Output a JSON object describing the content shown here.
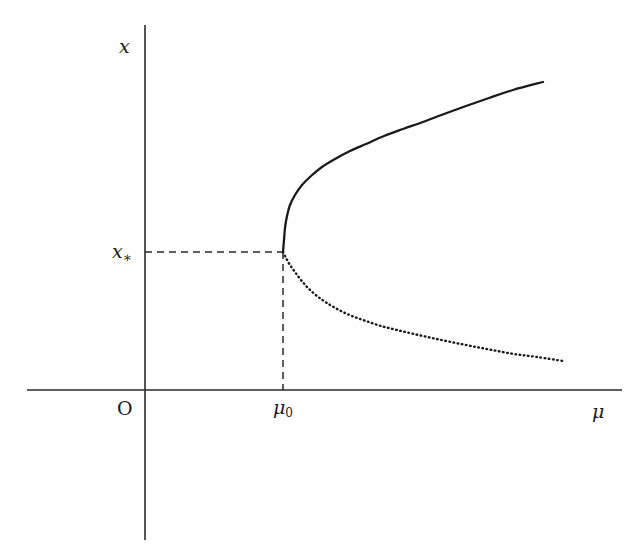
{
  "figure": {
    "name": "bifurcation-diagram",
    "background_color": "#fefefe",
    "ink_color": "#1a1a1a",
    "width": 638,
    "height": 559
  },
  "labels": {
    "y_axis": "x",
    "x_axis": "μ",
    "origin": "O",
    "x_star_base": "x",
    "x_star_sub": "∗",
    "mu_zero_base": "μ",
    "mu_zero_sub": "0"
  },
  "chart_data": {
    "type": "line",
    "title": "",
    "subtitle": "",
    "xlabel": "μ",
    "ylabel": "x",
    "grid": false,
    "legend": null,
    "axes": {
      "origin_label": "O",
      "x_axis": {
        "pixel_y": 390,
        "pixel_x_start": 27,
        "pixel_x_end": 622,
        "label": "μ",
        "ticks": [
          {
            "label": "μ₀",
            "pixel_x": 283
          }
        ]
      },
      "y_axis": {
        "pixel_x": 145,
        "pixel_y_start": 25,
        "pixel_y_end": 540,
        "label": "x",
        "ticks": [
          {
            "label": "x∗",
            "pixel_y": 252
          }
        ]
      }
    },
    "annotations": [
      {
        "name": "bifurcation-point",
        "pixel_x": 283,
        "pixel_y": 252,
        "x_label": "μ₀",
        "y_label": "x∗"
      },
      {
        "name": "guide-line-horizontal",
        "style": "dashed",
        "from": [
          145,
          252
        ],
        "to": [
          283,
          252
        ]
      },
      {
        "name": "guide-line-vertical",
        "style": "dashed",
        "from": [
          283,
          252
        ],
        "to": [
          283,
          390
        ]
      }
    ],
    "series": [
      {
        "name": "stable-branch",
        "style": "solid",
        "description": "upper stable equilibrium branch",
        "points": [
          [
            283,
            252
          ],
          [
            284,
            240
          ],
          [
            285,
            228
          ],
          [
            287,
            216
          ],
          [
            290,
            205
          ],
          [
            295,
            195
          ],
          [
            302,
            185
          ],
          [
            311,
            176
          ],
          [
            322,
            167
          ],
          [
            335,
            159
          ],
          [
            350,
            151
          ],
          [
            366,
            144
          ],
          [
            384,
            136
          ],
          [
            403,
            129
          ],
          [
            423,
            122
          ],
          [
            444,
            114
          ],
          [
            466,
            106
          ],
          [
            489,
            98
          ],
          [
            513,
            90
          ],
          [
            543,
            82
          ]
        ]
      },
      {
        "name": "unstable-branch",
        "style": "dotted",
        "description": "lower unstable equilibrium branch",
        "points": [
          [
            283,
            252
          ],
          [
            286,
            258
          ],
          [
            290,
            265
          ],
          [
            295,
            272
          ],
          [
            301,
            280
          ],
          [
            308,
            288
          ],
          [
            317,
            296
          ],
          [
            327,
            303
          ],
          [
            339,
            310
          ],
          [
            352,
            316
          ],
          [
            366,
            321
          ],
          [
            381,
            326
          ],
          [
            397,
            330
          ],
          [
            414,
            334
          ],
          [
            432,
            338
          ],
          [
            451,
            342
          ],
          [
            471,
            346
          ],
          [
            492,
            350
          ],
          [
            514,
            354
          ],
          [
            537,
            357
          ],
          [
            563,
            361
          ]
        ]
      }
    ]
  }
}
